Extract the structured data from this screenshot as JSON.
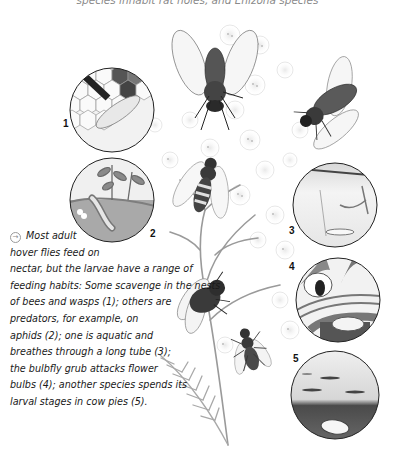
{
  "header": {
    "caption_fragment": "species inhabit rat holes, and Enizona species"
  },
  "illustration": {
    "subject": "hover flies on umbellifer flower heads with larval habitat insets",
    "insets": [
      {
        "number": "1",
        "label": "larva scavenging in bee/wasp nest comb"
      },
      {
        "number": "2",
        "label": "predatory larva among aphids on plant"
      },
      {
        "number": "3",
        "label": "aquatic rat-tailed larva breathing through long tube"
      },
      {
        "number": "4",
        "label": "bulbfly grub attacking flower bulb"
      },
      {
        "number": "5",
        "label": "larva in cow pie"
      }
    ]
  },
  "caption": {
    "icon": "arrow-circle-icon",
    "lines": [
      "Most adult",
      "hover flies feed on",
      "nectar, but the larvae have a range of",
      "feeding habits: Some scavenge in the nests",
      "of bees and wasps (1); others are",
      "predators, for example, on",
      "aphids (2); one is aquatic and",
      "breathes through a long tube (3);",
      "the bulbfly grub attacks flower",
      "bulbs (4); another species spends its",
      "larval stages in cow pies (5)."
    ]
  },
  "colors": {
    "text": "#1a1a1a",
    "muted": "#8a8a8a",
    "background": "#ffffff"
  }
}
